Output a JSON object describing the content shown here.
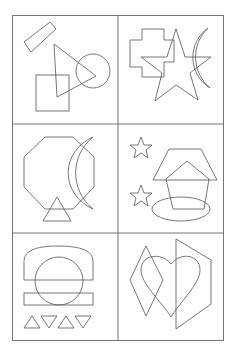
{
  "figure": {
    "stroke_color": "#555555",
    "grid_color": "#777777",
    "background": "#ffffff",
    "panels": [
      {
        "id": 1,
        "shapes": [
          "rotated-rectangle",
          "triangle",
          "circle",
          "square"
        ]
      },
      {
        "id": 2,
        "shapes": [
          "cross",
          "star",
          "crescent"
        ]
      },
      {
        "id": 3,
        "shapes": [
          "octagon",
          "crescent",
          "triangle"
        ]
      },
      {
        "id": 4,
        "shapes": [
          "star",
          "star",
          "trapezoid",
          "pentagon",
          "ellipse"
        ]
      },
      {
        "id": 5,
        "shapes": [
          "dome",
          "circle",
          "rectangle",
          "triangle-up",
          "triangle-down",
          "triangle-up",
          "triangle-down"
        ]
      },
      {
        "id": 6,
        "shapes": [
          "diamond",
          "heart",
          "hexagon"
        ]
      }
    ]
  }
}
